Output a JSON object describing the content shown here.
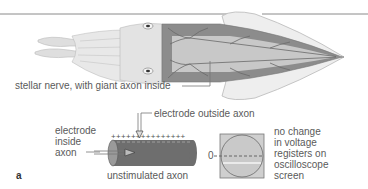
{
  "figure": {
    "panel_label": "a",
    "top_illustration": {
      "subject": "squid",
      "callout": "stellar nerve, with giant axon inside"
    },
    "axon_diagram": {
      "label_inside": [
        "electrode",
        "inside",
        "axon"
      ],
      "label_outside": "electrode outside axon",
      "caption": "unstimulated axon",
      "outer_charge": "+",
      "inner_charge": "-"
    },
    "oscilloscope": {
      "zero_label": "0",
      "description": [
        "no change",
        "in voltage",
        "registers on",
        "oscilloscope",
        "screen"
      ]
    },
    "colors": {
      "rule_line": "#8a8a8a",
      "axon_fill": "#6e6e6e",
      "squid_body": "#e6e6e6",
      "mantle": "#8c8c8c",
      "screen_bg": "#c9c9c9"
    }
  }
}
